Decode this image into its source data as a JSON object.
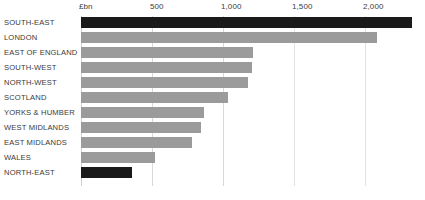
{
  "chart_data": {
    "type": "bar",
    "orientation": "horizontal",
    "title": "",
    "subtitle": "",
    "xlabel": "£bn",
    "ylabel": "",
    "unit_label": "£bn",
    "categories": [
      "SOUTH-EAST",
      "LONDON",
      "EAST OF ENGLAND",
      "SOUTH-WEST",
      "NORTH-WEST",
      "SCOTLAND",
      "YORKS & HUMBER",
      "WEST MIDLANDS",
      "EAST MIDLANDS",
      "WALES",
      "NORTH-EAST"
    ],
    "values": [
      2330,
      2085,
      1210,
      1205,
      1175,
      1035,
      865,
      845,
      780,
      520,
      360
    ],
    "highlighted": [
      true,
      false,
      false,
      false,
      false,
      false,
      false,
      false,
      false,
      false,
      true
    ],
    "xlim": [
      0,
      2375
    ],
    "xticks": [
      0,
      500,
      1000,
      1500,
      2000
    ],
    "xticklabels": [
      "£bn",
      "500",
      "1,000",
      "1,500",
      "2,000"
    ],
    "grid": "vertical",
    "legend": "none",
    "colors": {
      "bar_default": "#9b9b9b",
      "bar_highlight": "#1a1a1a",
      "gridline": "#d8d8d8",
      "text": "#3a3a3a",
      "background": "#ffffff"
    }
  },
  "rows": [
    {
      "label": "SOUTH-EAST",
      "value": 2330,
      "highlight": true
    },
    {
      "label": "LONDON",
      "value": 2085,
      "highlight": false
    },
    {
      "label": "EAST OF ENGLAND",
      "value": 1210,
      "highlight": false
    },
    {
      "label": "SOUTH-WEST",
      "value": 1205,
      "highlight": false
    },
    {
      "label": "NORTH-WEST",
      "value": 1175,
      "highlight": false
    },
    {
      "label": "SCOTLAND",
      "value": 1035,
      "highlight": false
    },
    {
      "label": "YORKS & HUMBER",
      "value": 865,
      "highlight": false
    },
    {
      "label": "WEST MIDLANDS",
      "value": 845,
      "highlight": false
    },
    {
      "label": "EAST MIDLANDS",
      "value": 780,
      "highlight": false
    },
    {
      "label": "WALES",
      "value": 520,
      "highlight": false
    },
    {
      "label": "NORTH-EAST",
      "value": 360,
      "highlight": true
    }
  ],
  "axis": {
    "ticks": [
      {
        "value": 0,
        "label": "£bn"
      },
      {
        "value": 500,
        "label": "500"
      },
      {
        "value": 1000,
        "label": "1,000"
      },
      {
        "value": 1500,
        "label": "1,500"
      },
      {
        "value": 2000,
        "label": "2,000"
      }
    ]
  }
}
